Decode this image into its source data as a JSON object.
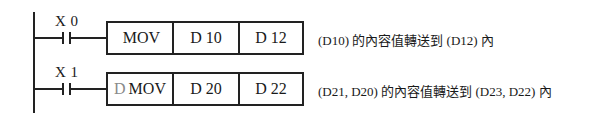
{
  "diagram": {
    "type": "PLC ladder diagram",
    "rungs": [
      {
        "contact": {
          "label": "X 0",
          "type": "normally-open"
        },
        "instruction": {
          "prefix": "",
          "opcode": "MOV",
          "source": "D 10",
          "destination": "D 12"
        },
        "description": "(D10) 的內容值轉送到 (D12) 內"
      },
      {
        "contact": {
          "label": "X 1",
          "type": "normally-open"
        },
        "instruction": {
          "prefix": "D",
          "opcode": "MOV",
          "source": "D 20",
          "destination": "D 22"
        },
        "description": "(D21, D20) 的內容值轉送到 (D23, D22) 內"
      }
    ]
  }
}
